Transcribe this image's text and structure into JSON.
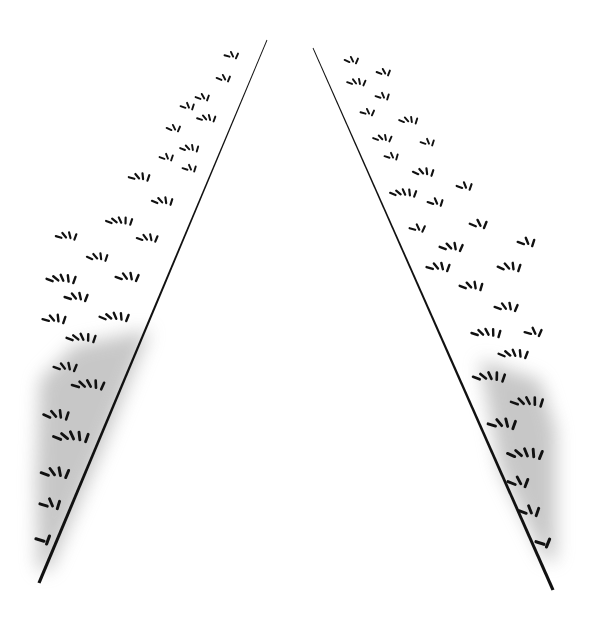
{
  "figure": {
    "width": 590,
    "height": 627,
    "background": "#ffffff",
    "ink": "#111111",
    "shade_color": "#9a9a9a",
    "lines": [
      {
        "id": "left-boundary-line",
        "x1": 267,
        "y1": 40,
        "x2": 39,
        "y2": 583,
        "stroke_width": 2.6
      },
      {
        "id": "right-boundary-line",
        "x1": 313,
        "y1": 48,
        "x2": 553,
        "y2": 590,
        "stroke_width": 2.6
      }
    ],
    "shaded_regions": [
      {
        "id": "left-shaded-region",
        "points": "150,330 104,445 50,570 38,570 36,480 40,380 75,345"
      },
      {
        "id": "right-shaded-region",
        "points": "480,360 540,380 556,430 556,560 545,560 500,470"
      }
    ],
    "left_clusters": [
      {
        "x": 232,
        "y": 56,
        "n": 3,
        "s": 0.8
      },
      {
        "x": 224,
        "y": 79,
        "n": 3,
        "s": 0.8
      },
      {
        "x": 203,
        "y": 98,
        "n": 3,
        "s": 0.8
      },
      {
        "x": 188,
        "y": 107,
        "n": 3,
        "s": 0.8
      },
      {
        "x": 207,
        "y": 119,
        "n": 4,
        "s": 0.8
      },
      {
        "x": 174,
        "y": 129,
        "n": 3,
        "s": 0.8
      },
      {
        "x": 190,
        "y": 149,
        "n": 4,
        "s": 0.8
      },
      {
        "x": 167,
        "y": 158,
        "n": 3,
        "s": 0.8
      },
      {
        "x": 190,
        "y": 169,
        "n": 3,
        "s": 0.8
      },
      {
        "x": 140,
        "y": 178,
        "n": 4,
        "s": 0.9
      },
      {
        "x": 163,
        "y": 202,
        "n": 4,
        "s": 0.9
      },
      {
        "x": 120,
        "y": 222,
        "n": 5,
        "s": 0.9
      },
      {
        "x": 148,
        "y": 239,
        "n": 4,
        "s": 0.9
      },
      {
        "x": 67,
        "y": 237,
        "n": 4,
        "s": 0.9
      },
      {
        "x": 98,
        "y": 258,
        "n": 4,
        "s": 0.9
      },
      {
        "x": 62,
        "y": 280,
        "n": 5,
        "s": 1.0
      },
      {
        "x": 128,
        "y": 278,
        "n": 4,
        "s": 1.0
      },
      {
        "x": 77,
        "y": 298,
        "n": 4,
        "s": 1.0
      },
      {
        "x": 55,
        "y": 320,
        "n": 4,
        "s": 1.0
      },
      {
        "x": 115,
        "y": 318,
        "n": 5,
        "s": 1.0
      },
      {
        "x": 82,
        "y": 339,
        "n": 5,
        "s": 1.0
      },
      {
        "x": 66,
        "y": 368,
        "n": 4,
        "s": 1.0
      },
      {
        "x": 89,
        "y": 386,
        "n": 5,
        "s": 1.1
      },
      {
        "x": 57,
        "y": 416,
        "n": 4,
        "s": 1.1
      },
      {
        "x": 72,
        "y": 438,
        "n": 5,
        "s": 1.2
      },
      {
        "x": 56,
        "y": 474,
        "n": 4,
        "s": 1.2
      },
      {
        "x": 51,
        "y": 505,
        "n": 3,
        "s": 1.2
      },
      {
        "x": 44,
        "y": 540,
        "n": 2,
        "s": 1.3
      }
    ],
    "right_clusters": [
      {
        "x": 352,
        "y": 61,
        "n": 3,
        "s": 0.8
      },
      {
        "x": 384,
        "y": 73,
        "n": 3,
        "s": 0.8
      },
      {
        "x": 357,
        "y": 83,
        "n": 4,
        "s": 0.8
      },
      {
        "x": 383,
        "y": 97,
        "n": 3,
        "s": 0.8
      },
      {
        "x": 368,
        "y": 113,
        "n": 3,
        "s": 0.8
      },
      {
        "x": 409,
        "y": 121,
        "n": 4,
        "s": 0.8
      },
      {
        "x": 383,
        "y": 139,
        "n": 4,
        "s": 0.8
      },
      {
        "x": 428,
        "y": 143,
        "n": 3,
        "s": 0.8
      },
      {
        "x": 392,
        "y": 157,
        "n": 3,
        "s": 0.8
      },
      {
        "x": 424,
        "y": 173,
        "n": 4,
        "s": 0.9
      },
      {
        "x": 404,
        "y": 194,
        "n": 5,
        "s": 0.9
      },
      {
        "x": 465,
        "y": 187,
        "n": 3,
        "s": 0.9
      },
      {
        "x": 436,
        "y": 203,
        "n": 3,
        "s": 0.9
      },
      {
        "x": 418,
        "y": 229,
        "n": 3,
        "s": 0.9
      },
      {
        "x": 479,
        "y": 225,
        "n": 3,
        "s": 1.0
      },
      {
        "x": 452,
        "y": 248,
        "n": 4,
        "s": 1.0
      },
      {
        "x": 527,
        "y": 243,
        "n": 3,
        "s": 1.0
      },
      {
        "x": 439,
        "y": 268,
        "n": 4,
        "s": 1.0
      },
      {
        "x": 510,
        "y": 268,
        "n": 4,
        "s": 1.0
      },
      {
        "x": 472,
        "y": 287,
        "n": 4,
        "s": 1.0
      },
      {
        "x": 507,
        "y": 308,
        "n": 4,
        "s": 1.0
      },
      {
        "x": 487,
        "y": 334,
        "n": 5,
        "s": 1.0
      },
      {
        "x": 534,
        "y": 333,
        "n": 3,
        "s": 1.0
      },
      {
        "x": 514,
        "y": 355,
        "n": 5,
        "s": 1.0
      },
      {
        "x": 490,
        "y": 378,
        "n": 5,
        "s": 1.1
      },
      {
        "x": 528,
        "y": 403,
        "n": 5,
        "s": 1.1
      },
      {
        "x": 503,
        "y": 425,
        "n": 4,
        "s": 1.2
      },
      {
        "x": 526,
        "y": 455,
        "n": 5,
        "s": 1.2
      },
      {
        "x": 519,
        "y": 483,
        "n": 3,
        "s": 1.2
      },
      {
        "x": 530,
        "y": 512,
        "n": 3,
        "s": 1.2
      },
      {
        "x": 544,
        "y": 543,
        "n": 2,
        "s": 1.3
      }
    ]
  }
}
